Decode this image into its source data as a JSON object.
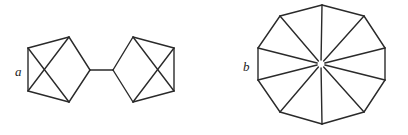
{
  "figures": [
    {
      "id": "a",
      "label": "a",
      "label_pos": [
        15,
        76
      ],
      "description": "Two pentagonal cages joined by a single bond",
      "vertices": {
        "L1": [
          28,
          48
        ],
        "L2": [
          69,
          37
        ],
        "L3": [
          90,
          70
        ],
        "L4": [
          69,
          102
        ],
        "L5": [
          28,
          91
        ],
        "R1": [
          113,
          70
        ],
        "R2": [
          133,
          37
        ],
        "R3": [
          174,
          48
        ],
        "R4": [
          174,
          91
        ],
        "R5": [
          133,
          102
        ]
      },
      "edges": [
        [
          "L1",
          "L2"
        ],
        [
          "L2",
          "L3"
        ],
        [
          "L3",
          "L4"
        ],
        [
          "L4",
          "L5"
        ],
        [
          "L5",
          "L1"
        ],
        [
          "L1",
          "L4"
        ],
        [
          "L5",
          "L2"
        ],
        [
          "L3",
          "R1"
        ],
        [
          "R1",
          "R2"
        ],
        [
          "R2",
          "R3"
        ],
        [
          "R3",
          "R4"
        ],
        [
          "R4",
          "R5"
        ],
        [
          "R5",
          "R1"
        ],
        [
          "R2",
          "R4"
        ],
        [
          "R3",
          "R5"
        ]
      ]
    },
    {
      "id": "b",
      "label": "b",
      "label_pos": [
        243,
        71
      ],
      "description": "Decagon with ten spokes converging toward the center",
      "center": [
        321,
        64
      ],
      "vertices": [
        [
          322,
          5
        ],
        [
          364,
          16
        ],
        [
          385,
          48
        ],
        [
          385,
          80
        ],
        [
          364,
          112
        ],
        [
          322,
          124
        ],
        [
          280,
          112
        ],
        [
          258,
          80
        ],
        [
          258,
          48
        ],
        [
          280,
          16
        ]
      ],
      "spoke_gap": 4
    }
  ],
  "colors": {
    "line": "#2a2a2a",
    "background": "#ffffff",
    "label": "#222222"
  }
}
